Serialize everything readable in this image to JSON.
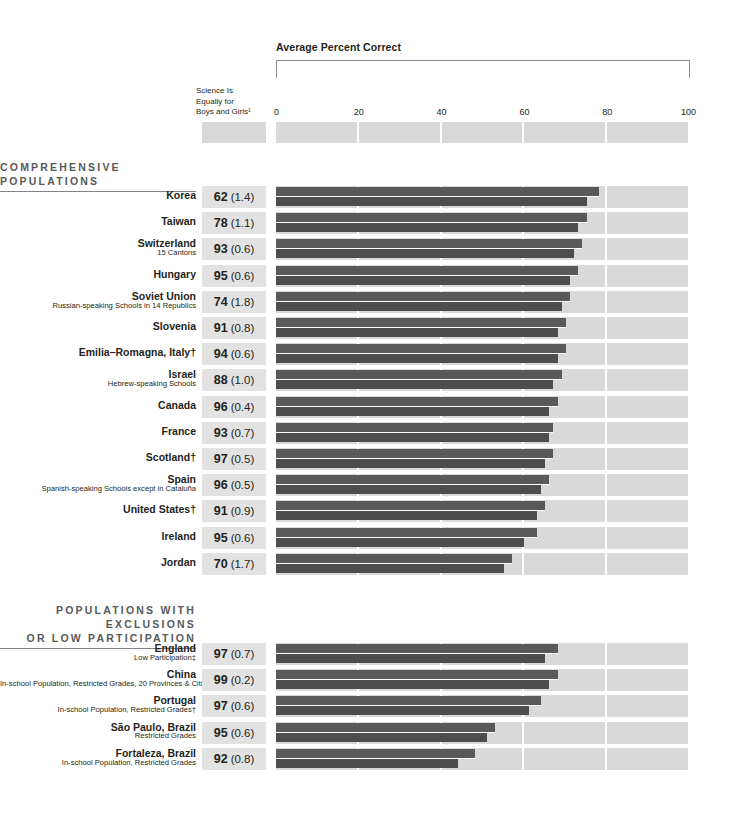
{
  "header": {
    "bracket_title": "Average Percent Correct",
    "value_column_header": "Science Is\nEqually for\nBoys and Girls¹",
    "value_column_header_lines": [
      "Science Is",
      "Equally for",
      "Boys and Girls¹"
    ]
  },
  "sections": [
    {
      "id": "comprehensive",
      "title_lines": [
        "COMPREHENSIVE POPULATIONS"
      ]
    },
    {
      "id": "exclusions",
      "title_lines": [
        "POPULATIONS WITH EXCLUSIONS",
        "OR LOW PARTICIPATION"
      ]
    }
  ],
  "colors": {
    "bar_top": "#595959",
    "bar_bottom": "#4d4d4d",
    "band": "#d9d9d9",
    "value_box": "#e2e2e2",
    "section_title": "#58595b",
    "text": "#231f20"
  },
  "chart_data": {
    "type": "bar",
    "title": "Average Percent Correct",
    "xlabel": "Average Percent Correct",
    "ylabel": "",
    "xlim": [
      0,
      100
    ],
    "ticks": [
      0,
      20,
      40,
      60,
      80,
      100
    ],
    "grid": true,
    "legend_position": "none",
    "value_column_label": "Science Is Equally for Boys and Girls¹",
    "series": [
      {
        "name": "Agree — Average Percent Correct",
        "key": "bar_top"
      },
      {
        "name": "Disagree — Average Percent Correct",
        "key": "bar_bottom"
      }
    ],
    "groups": [
      {
        "section": "COMPREHENSIVE POPULATIONS",
        "rows": [
          {
            "name": "Korea",
            "sub": "",
            "percent": "62",
            "se": "(1.4)",
            "bar_top": 78,
            "bar_bot": 75
          },
          {
            "name": "Taiwan",
            "sub": "",
            "percent": "78",
            "se": "(1.1)",
            "bar_top": 75,
            "bar_bot": 73
          },
          {
            "name": "Switzerland",
            "sub": "15 Cantons",
            "percent": "93",
            "se": "(0.6)",
            "bar_top": 74,
            "bar_bot": 72
          },
          {
            "name": "Hungary",
            "sub": "",
            "percent": "95",
            "se": "(0.6)",
            "bar_top": 73,
            "bar_bot": 71
          },
          {
            "name": "Soviet Union",
            "sub": "Russian-speaking Schools in 14 Republics",
            "percent": "74",
            "se": "(1.8)",
            "bar_top": 71,
            "bar_bot": 69
          },
          {
            "name": "Slovenia",
            "sub": "",
            "percent": "91",
            "se": "(0.8)",
            "bar_top": 70,
            "bar_bot": 68
          },
          {
            "name": "Emilia–Romagna, Italy†",
            "sub": "",
            "percent": "94",
            "se": "(0.6)",
            "bar_top": 70,
            "bar_bot": 68
          },
          {
            "name": "Israel",
            "sub": "Hebrew-speaking Schools",
            "percent": "88",
            "se": "(1.0)",
            "bar_top": 69,
            "bar_bot": 67
          },
          {
            "name": "Canada",
            "sub": "",
            "percent": "96",
            "se": "(0.4)",
            "bar_top": 68,
            "bar_bot": 66
          },
          {
            "name": "France",
            "sub": "",
            "percent": "93",
            "se": "(0.7)",
            "bar_top": 67,
            "bar_bot": 66
          },
          {
            "name": "Scotland†",
            "sub": "",
            "percent": "97",
            "se": "(0.5)",
            "bar_top": 67,
            "bar_bot": 65
          },
          {
            "name": "Spain",
            "sub": "Spanish-speaking Schools except in Cataluña",
            "percent": "96",
            "se": "(0.5)",
            "bar_top": 66,
            "bar_bot": 64
          },
          {
            "name": "United States†",
            "sub": "",
            "percent": "91",
            "se": "(0.9)",
            "bar_top": 65,
            "bar_bot": 63
          },
          {
            "name": "Ireland",
            "sub": "",
            "percent": "95",
            "se": "(0.6)",
            "bar_top": 63,
            "bar_bot": 60
          },
          {
            "name": "Jordan",
            "sub": "",
            "percent": "70",
            "se": "(1.7)",
            "bar_top": 57,
            "bar_bot": 55
          }
        ]
      },
      {
        "section": "POPULATIONS WITH EXCLUSIONS OR LOW PARTICIPATION",
        "rows": [
          {
            "name": "England",
            "sub": "Low Participation‡",
            "percent": "97",
            "se": "(0.7)",
            "bar_top": 68,
            "bar_bot": 65
          },
          {
            "name": "China",
            "sub": "In-school Population, Restricted Grades, 20 Provinces & Cities",
            "percent": "99",
            "se": "(0.2)",
            "bar_top": 68,
            "bar_bot": 66
          },
          {
            "name": "Portugal",
            "sub": "In-school Population, Restricted Grades†",
            "percent": "97",
            "se": "(0.6)",
            "bar_top": 64,
            "bar_bot": 61
          },
          {
            "name": "São Paulo, Brazil",
            "sub": "Restricted Grades",
            "percent": "95",
            "se": "(0.6)",
            "bar_top": 53,
            "bar_bot": 51
          },
          {
            "name": "Fortaleza, Brazil",
            "sub": "In-school Population, Restricted Grades",
            "percent": "92",
            "se": "(0.8)",
            "bar_top": 48,
            "bar_bot": 44
          }
        ]
      }
    ]
  }
}
